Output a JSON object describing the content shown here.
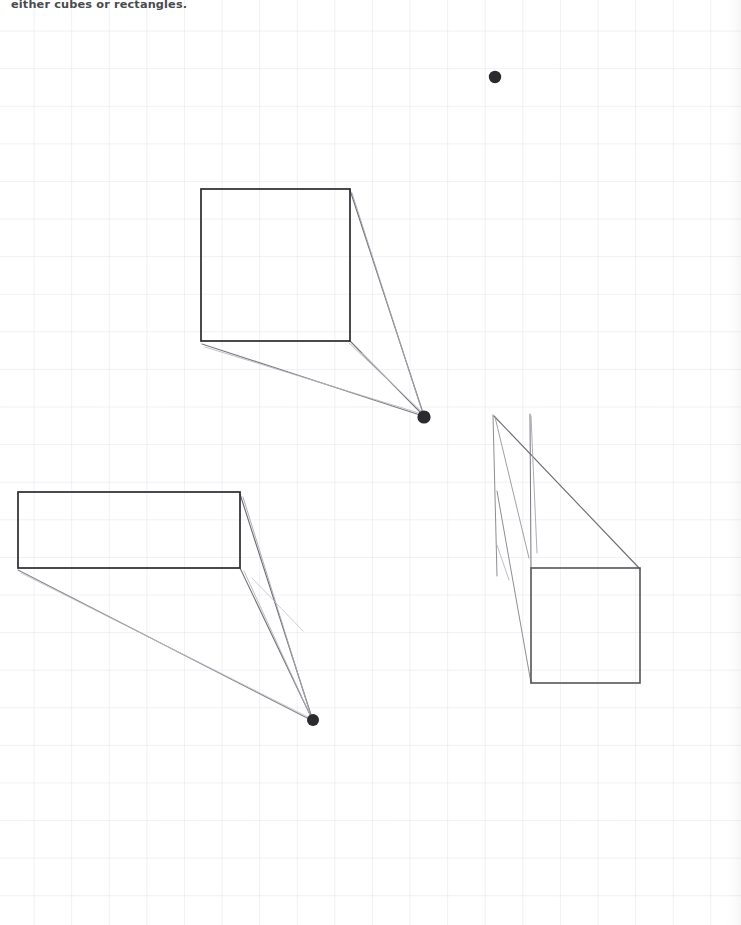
{
  "page": {
    "width": 741,
    "height": 925,
    "background_color": "#ffffff",
    "grid_color": "#dee0e6",
    "grid_spacing_px": 37.6,
    "instruction_text": "either cubes or rectangles."
  },
  "ink": {
    "primary_color": "#2b2b2f",
    "faint_color": "#8e8e94",
    "very_faint_color": "#b9b9c0"
  },
  "drawing": {
    "title": "one-point-perspective-exercise",
    "vanishing_points": [
      {
        "name": "vanishing-point-top",
        "x": 495,
        "y": 77,
        "r": 6.2,
        "color": "#2b2b2f"
      },
      {
        "name": "vanishing-point-middle",
        "x": 424,
        "y": 417,
        "r": 6.6,
        "color": "#2b2b2f"
      },
      {
        "name": "vanishing-point-lower",
        "x": 313,
        "y": 720,
        "r": 6.0,
        "color": "#2b2b2f"
      }
    ],
    "shapes": [
      {
        "name": "front-face-square-upper",
        "type": "rect",
        "x": 201,
        "y": 189,
        "w": 149,
        "h": 152,
        "stroke": "#2b2b2f",
        "stroke_width": 1.7
      },
      {
        "name": "front-face-rectangle-left",
        "type": "rect",
        "x": 18,
        "y": 492,
        "w": 222,
        "h": 76,
        "stroke": "#2b2b2f",
        "stroke_width": 1.7
      },
      {
        "name": "front-face-square-right",
        "type": "rect",
        "x": 531,
        "y": 568,
        "w": 109,
        "h": 115,
        "stroke": "#555559",
        "stroke_width": 1.6
      }
    ],
    "construction_lines": [
      {
        "name": "guide-upper-topright-to-vp",
        "x1": 350,
        "y1": 190,
        "x2": 424,
        "y2": 416,
        "stroke": "#6e6e75",
        "stroke_width": 1.15
      },
      {
        "name": "guide-upper-topright-to-vp-ghost",
        "x1": 352,
        "y1": 193,
        "x2": 423,
        "y2": 414,
        "stroke": "#a8a8b0",
        "stroke_width": 0.9
      },
      {
        "name": "guide-upper-bottomright-to-vp",
        "x1": 350,
        "y1": 341,
        "x2": 423,
        "y2": 415,
        "stroke": "#73737a",
        "stroke_width": 1.1
      },
      {
        "name": "guide-upper-bottomright-to-vp-ghost",
        "x1": 349,
        "y1": 343,
        "x2": 424,
        "y2": 414,
        "stroke": "#b0b0b8",
        "stroke_width": 0.85
      },
      {
        "name": "guide-upper-bottomleft-to-vp",
        "x1": 202,
        "y1": 344,
        "x2": 423,
        "y2": 416,
        "stroke": "#7c7c84",
        "stroke_width": 1.1
      },
      {
        "name": "guide-upper-bottomleft-to-vp-ghost",
        "x1": 205,
        "y1": 347,
        "x2": 422,
        "y2": 414,
        "stroke": "#b6b6bd",
        "stroke_width": 0.85
      },
      {
        "name": "guide-upper-stray-short",
        "x1": 362,
        "y1": 353,
        "x2": 419,
        "y2": 410,
        "stroke": "#c2c2c9",
        "stroke_width": 0.85
      },
      {
        "name": "guide-rect-topright-to-vp",
        "x1": 240,
        "y1": 494,
        "x2": 312,
        "y2": 718,
        "stroke": "#6e6e75",
        "stroke_width": 1.15
      },
      {
        "name": "guide-rect-topright-to-vp-ghost",
        "x1": 243,
        "y1": 497,
        "x2": 311,
        "y2": 716,
        "stroke": "#a8a8b0",
        "stroke_width": 0.9
      },
      {
        "name": "guide-rect-bottomright-to-vp",
        "x1": 240,
        "y1": 568,
        "x2": 312,
        "y2": 719,
        "stroke": "#73737a",
        "stroke_width": 1.1
      },
      {
        "name": "guide-rect-bottomright-to-vp-ghost",
        "x1": 244,
        "y1": 571,
        "x2": 311,
        "y2": 717,
        "stroke": "#b0b0b8",
        "stroke_width": 0.85
      },
      {
        "name": "guide-rect-bottomleft-to-vp",
        "x1": 18,
        "y1": 570,
        "x2": 311,
        "y2": 720,
        "stroke": "#85858d",
        "stroke_width": 1.05
      },
      {
        "name": "guide-rect-bottomleft-to-vp-ghost",
        "x1": 21,
        "y1": 573,
        "x2": 310,
        "y2": 718,
        "stroke": "#bcbcc3",
        "stroke_width": 0.8
      },
      {
        "name": "guide-rect-stray-short",
        "x1": 252,
        "y1": 578,
        "x2": 303,
        "y2": 631,
        "stroke": "#c2c2c9",
        "stroke_width": 0.8
      },
      {
        "name": "guide-right-vertical-outer",
        "x1": 493,
        "y1": 415,
        "x2": 497,
        "y2": 576,
        "stroke": "#8d8d95",
        "stroke_width": 1.0
      },
      {
        "name": "guide-right-vertical-inner",
        "x1": 530,
        "y1": 414,
        "x2": 531,
        "y2": 568,
        "stroke": "#7c7c84",
        "stroke_width": 1.05
      },
      {
        "name": "guide-right-diagonal-to-topright",
        "x1": 494,
        "y1": 416,
        "x2": 640,
        "y2": 569,
        "stroke": "#6e6e75",
        "stroke_width": 1.15
      },
      {
        "name": "guide-right-curve-a",
        "x1": 495,
        "y1": 417,
        "x2": 529,
        "y2": 558,
        "stroke": "#9a9aa2",
        "stroke_width": 0.95
      },
      {
        "name": "guide-right-curve-b",
        "x1": 531,
        "y1": 416,
        "x2": 537,
        "y2": 553,
        "stroke": "#a5a5ad",
        "stroke_width": 0.9
      },
      {
        "name": "guide-right-long-to-bottomleft",
        "x1": 497,
        "y1": 491,
        "x2": 531,
        "y2": 683,
        "stroke": "#8d8d95",
        "stroke_width": 1.0
      },
      {
        "name": "guide-right-short-hook",
        "x1": 497,
        "y1": 545,
        "x2": 509,
        "y2": 580,
        "stroke": "#b4b4bb",
        "stroke_width": 0.85
      }
    ]
  }
}
